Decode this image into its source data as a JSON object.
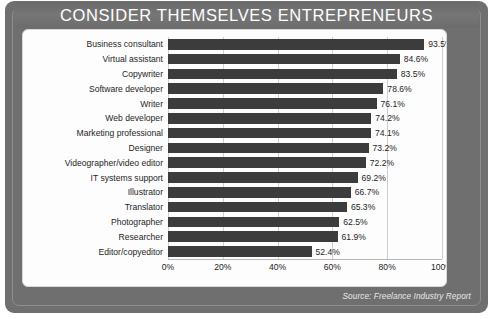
{
  "header": {
    "title": "CONSIDER THEMSELVES ENTREPRENEURS"
  },
  "footer": {
    "source": "Source: Freelance Industry Report"
  },
  "colors": {
    "frame": "#6f6f6f",
    "title_bar": "#737373",
    "bar": "#3c3c3c",
    "card": "#fdfdfd",
    "gridline": "#cfcfcf",
    "text": "#1d1d1d"
  },
  "chart_data": {
    "type": "bar",
    "orientation": "horizontal",
    "title": "CONSIDER THEMSELVES ENTREPRENEURS",
    "xlabel": "",
    "ylabel": "",
    "xlim": [
      0,
      100
    ],
    "grid": true,
    "legend": "none",
    "xticks": [
      "0%",
      "20%",
      "40%",
      "60%",
      "80%",
      "100%"
    ],
    "xtick_values": [
      0,
      20,
      40,
      60,
      80,
      100
    ],
    "categories": [
      "Business consultant",
      "Virtual assistant",
      "Copywriter",
      "Software developer",
      "Writer",
      "Web developer",
      "Marketing professional",
      "Designer",
      "Videographer/video editor",
      "IT systems support",
      "Illustrator",
      "Translator",
      "Photographer",
      "Researcher",
      "Editor/copyeditor"
    ],
    "values": [
      93.5,
      84.6,
      83.5,
      78.6,
      76.1,
      74.2,
      74.1,
      73.2,
      72.2,
      69.2,
      66.7,
      65.3,
      62.5,
      61.9,
      52.4
    ],
    "value_labels": [
      "93.5%",
      "84.6%",
      "83.5%",
      "78.6%",
      "76.1%",
      "74.2%",
      "74.1%",
      "73.2%",
      "72.2%",
      "69.2%",
      "66.7%",
      "65.3%",
      "62.5%",
      "61.9%",
      "52.4%"
    ]
  }
}
